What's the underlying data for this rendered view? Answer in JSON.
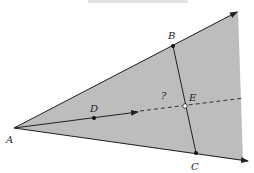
{
  "figure": {
    "caption_cut_off": "",
    "colors": {
      "region_fill": "#bdbdbd",
      "line": "#222222",
      "background": "#ffffff"
    },
    "points": {
      "A": {
        "label": "A",
        "x": 14,
        "y": 128
      },
      "B": {
        "label": "B",
        "x": 173,
        "y": 46
      },
      "C": {
        "label": "C",
        "x": 196,
        "y": 153
      },
      "D": {
        "label": "D",
        "x": 94,
        "y": 118
      },
      "E": {
        "label": "E",
        "x": 185,
        "y": 106
      }
    },
    "question_mark": "?"
  }
}
